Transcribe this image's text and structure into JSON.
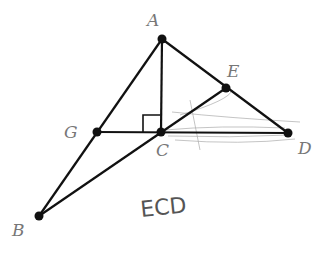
{
  "diagram": {
    "points": {
      "A": {
        "label": "A",
        "x": 162,
        "y": 39
      },
      "E": {
        "label": "E",
        "x": 226,
        "y": 88
      },
      "G": {
        "label": "G",
        "x": 97,
        "y": 132
      },
      "C": {
        "label": "C",
        "x": 161,
        "y": 132
      },
      "D": {
        "label": "D",
        "x": 288,
        "y": 133
      },
      "B": {
        "label": "B",
        "x": 39,
        "y": 216
      }
    },
    "segments": [
      "AB",
      "AC",
      "AD",
      "GD",
      "BE"
    ],
    "right_angle_at": "C",
    "handwritten_note": "ECD"
  }
}
